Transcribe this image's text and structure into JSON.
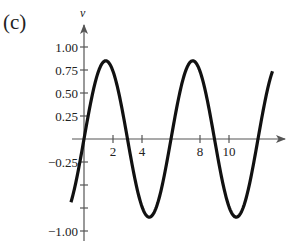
{
  "panel_label": "(c)",
  "chart_data": {
    "type": "line",
    "title": "",
    "xlabel": "",
    "ylabel": "v",
    "x_ticks": [
      2,
      4,
      6,
      8,
      10
    ],
    "x_tick_labels": [
      "2",
      "4",
      "",
      "8",
      "10"
    ],
    "y_ticks": [
      1.0,
      0.75,
      0.5,
      0.25,
      -0.25,
      -0.5,
      -0.75,
      -1.0
    ],
    "y_tick_labels": [
      "1.00",
      "0.75",
      "0.50",
      "0.25",
      "-0.25",
      "",
      "",
      "-1.00"
    ],
    "xlim": [
      -0.9,
      13
    ],
    "ylim": [
      -1.1,
      1.2
    ],
    "grid": false,
    "legend": null,
    "series": [
      {
        "name": "v(t)",
        "function": "0.85 * sin(pi * t / 3)",
        "amplitude": 0.85,
        "period": 6,
        "x": [
          -0.9,
          0,
          1.5,
          3,
          4.5,
          6,
          7.5,
          9,
          10.5,
          12,
          13
        ],
        "values": [
          -0.69,
          0,
          0.85,
          0,
          -0.85,
          0,
          0.85,
          0,
          -0.85,
          0,
          0.74
        ],
        "color": "#111111"
      }
    ]
  }
}
